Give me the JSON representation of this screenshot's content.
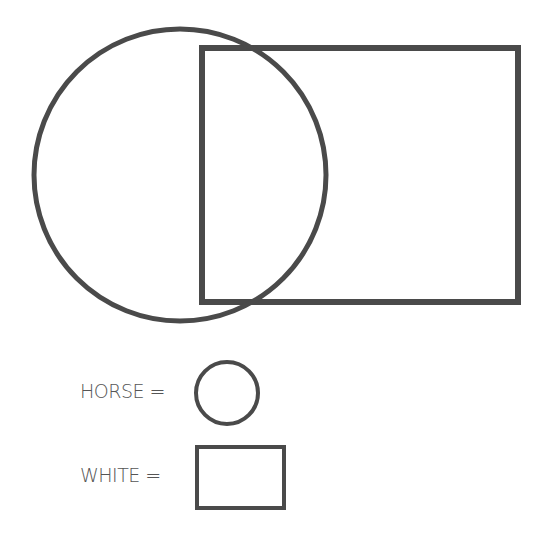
{
  "diagram": {
    "type": "venn",
    "stroke_color": "#4a4a4a",
    "background": "#ffffff",
    "shapes": [
      {
        "kind": "circle",
        "represents": "HORSE",
        "cx": 180,
        "cy": 175,
        "r": 146
      },
      {
        "kind": "rectangle",
        "represents": "WHITE",
        "x": 202,
        "y": 48,
        "width": 316,
        "height": 254
      }
    ]
  },
  "legend": {
    "items": [
      {
        "label": "HORSE =",
        "symbol": "circle"
      },
      {
        "label": "WHITE =",
        "symbol": "rectangle"
      }
    ]
  }
}
